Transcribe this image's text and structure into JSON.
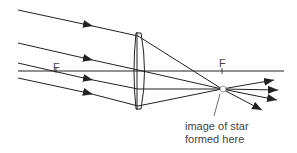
{
  "diagram": {
    "type": "ray-diagram",
    "labels": {
      "focal_left": "F",
      "focal_right": "F",
      "image_caption_line1": "image of star",
      "image_caption_line2": "formed here"
    },
    "colors": {
      "line": "#222222",
      "text": "#444444",
      "background": "#ffffff"
    },
    "elements": {
      "incoming_rays": 4,
      "outgoing_rays": 4,
      "principal_axis": true,
      "lens": "convex"
    }
  }
}
